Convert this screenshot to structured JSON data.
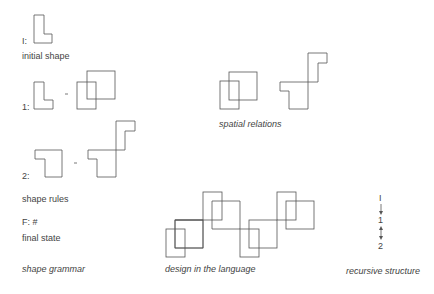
{
  "shape_grammar": {
    "initial_label": "I:",
    "initial_caption": "initial shape",
    "rule1_label": "1:",
    "rule2_label": "2:",
    "rules_caption": "shape rules",
    "final_label": "F: #",
    "final_caption": "final state",
    "title": "shape grammar",
    "arrow_glyph": "-"
  },
  "spatial_relations": {
    "caption": "spatial relations"
  },
  "design": {
    "caption": "design in the language"
  },
  "recursive_structure": {
    "items": [
      "I",
      "1",
      "2"
    ],
    "caption": "recursive structure"
  },
  "colors": {
    "stroke": "#555555",
    "text": "#444444",
    "background": "#ffffff"
  }
}
